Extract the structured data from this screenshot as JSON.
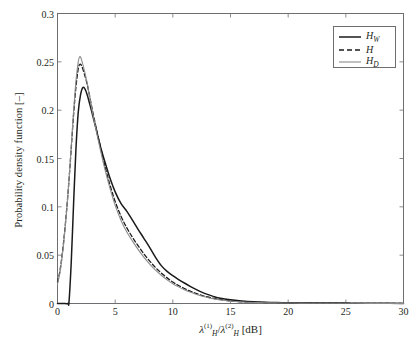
{
  "chart_data": {
    "type": "line",
    "title": "",
    "xlabel": "lambda_H^(1)/lambda_H^(2) [dB]",
    "ylabel": "Probability density function [-]",
    "xlabel_parts": {
      "lambda": "λ",
      "sup1": "(1)",
      "sub1": "H",
      "slash": "/",
      "sup2": "(2)",
      "sub2": "H",
      "units": "[dB]"
    },
    "xlim": [
      0,
      30
    ],
    "ylim": [
      0,
      0.3
    ],
    "xticks": [
      0,
      5,
      10,
      15,
      20,
      25,
      30
    ],
    "xtick_labels": [
      "0",
      "5",
      "10",
      "15",
      "20",
      "25",
      "30"
    ],
    "yticks": [
      0,
      0.05,
      0.1,
      0.15,
      0.2,
      0.25,
      0.3
    ],
    "ytick_labels": [
      "0",
      "0.05",
      "0.1",
      "0.15",
      "0.2",
      "0.25",
      "0.3"
    ],
    "grid": false,
    "legend_position": "upper right",
    "series": [
      {
        "name": "H_W",
        "label_base": "H",
        "label_sub": "W",
        "style": "solid",
        "color": "#1a1a1a",
        "width": 1.5,
        "x": [
          0.0,
          0.5,
          0.9,
          1.0,
          1.2,
          1.4,
          1.6,
          1.8,
          2.0,
          2.2,
          2.4,
          2.6,
          2.8,
          3.0,
          3.4,
          3.8,
          4.2,
          4.6,
          5.0,
          5.5,
          6.0,
          6.5,
          7.0,
          7.5,
          8.0,
          8.5,
          9.0,
          9.5,
          10.0,
          10.5,
          11.0,
          11.5,
          12.0,
          12.5,
          13.0,
          13.5,
          14.0,
          15.0,
          16.0,
          17.0,
          18.0,
          19.0,
          20.0,
          21.0,
          22.0,
          23.0,
          25.0,
          26.0,
          28.0,
          30.0
        ],
        "y": [
          0.0,
          0.0,
          0.0,
          0.002,
          0.045,
          0.105,
          0.16,
          0.198,
          0.216,
          0.2235,
          0.2215,
          0.215,
          0.206,
          0.197,
          0.178,
          0.159,
          0.143,
          0.128,
          0.1155,
          0.1035,
          0.0955,
          0.0862,
          0.0765,
          0.0672,
          0.0578,
          0.0478,
          0.0392,
          0.0332,
          0.0288,
          0.0248,
          0.0212,
          0.0178,
          0.0146,
          0.0118,
          0.0094,
          0.0074,
          0.0058,
          0.0038,
          0.0026,
          0.0018,
          0.0013,
          0.001,
          0.0008,
          0.0007,
          0.0006,
          0.0005,
          0.0004,
          0.0003,
          0.0002,
          0.0001
        ]
      },
      {
        "name": "H",
        "label_base": "H",
        "label_sub": "",
        "style": "dashed",
        "color": "#1a1a1a",
        "width": 1.3,
        "x": [
          0.0,
          0.2,
          0.4,
          0.6,
          0.8,
          1.0,
          1.2,
          1.4,
          1.6,
          1.8,
          1.95,
          2.1,
          2.3,
          2.6,
          3.0,
          3.4,
          3.8,
          4.2,
          4.6,
          5.0,
          5.5,
          6.0,
          6.5,
          7.0,
          7.5,
          8.0,
          8.5,
          9.0,
          9.5,
          10.0,
          10.5,
          11.0,
          11.5,
          12.0,
          12.5,
          13.0,
          13.5,
          14.0,
          15.0,
          16.0,
          17.0,
          18.0,
          19.0,
          20.0,
          21.0,
          22.0,
          24.0,
          26.0,
          28.0,
          30.0
        ],
        "y": [
          0.022,
          0.033,
          0.05,
          0.072,
          0.098,
          0.128,
          0.162,
          0.196,
          0.224,
          0.243,
          0.2475,
          0.2455,
          0.2385,
          0.2255,
          0.2015,
          0.179,
          0.158,
          0.138,
          0.1205,
          0.1055,
          0.0905,
          0.0785,
          0.0685,
          0.0595,
          0.0512,
          0.0438,
          0.0372,
          0.0315,
          0.0265,
          0.0222,
          0.0186,
          0.0155,
          0.0128,
          0.0105,
          0.0085,
          0.0068,
          0.0054,
          0.0043,
          0.0027,
          0.0018,
          0.0013,
          0.001,
          0.0008,
          0.0006,
          0.0005,
          0.0004,
          0.0003,
          0.0002,
          0.0001,
          0.0001
        ]
      },
      {
        "name": "H_D",
        "label_base": "H",
        "label_sub": "D",
        "style": "solid",
        "color": "#8c8c8c",
        "width": 1.1,
        "x": [
          0.0,
          0.2,
          0.4,
          0.6,
          0.8,
          1.0,
          1.2,
          1.4,
          1.6,
          1.8,
          1.95,
          2.1,
          2.3,
          2.6,
          3.0,
          3.4,
          3.8,
          4.2,
          4.6,
          5.0,
          5.5,
          6.0,
          6.5,
          7.0,
          7.5,
          8.0,
          8.5,
          9.0,
          9.5,
          10.0,
          10.5,
          11.0,
          11.5,
          12.0,
          12.5,
          13.0,
          13.5,
          14.0,
          15.0,
          16.0,
          17.0,
          18.0,
          19.0,
          20.0,
          21.0,
          22.0,
          24.0,
          26.0,
          28.0,
          30.0
        ],
        "y": [
          0.02,
          0.031,
          0.048,
          0.07,
          0.097,
          0.128,
          0.164,
          0.2,
          0.23,
          0.25,
          0.2555,
          0.2515,
          0.2425,
          0.2265,
          0.2,
          0.1765,
          0.1545,
          0.1345,
          0.117,
          0.1015,
          0.0862,
          0.0742,
          0.0645,
          0.0558,
          0.0478,
          0.0408,
          0.0345,
          0.0292,
          0.0245,
          0.0205,
          0.0172,
          0.0143,
          0.0118,
          0.0096,
          0.0078,
          0.0062,
          0.0049,
          0.0039,
          0.0024,
          0.0016,
          0.0011,
          0.0008,
          0.0006,
          0.0005,
          0.0004,
          0.0003,
          0.0002,
          0.0002,
          0.0001,
          0.0001
        ]
      }
    ]
  },
  "axes": {
    "frame_color": "#6d6e71",
    "background": "#ffffff",
    "tick_direction": "in"
  }
}
